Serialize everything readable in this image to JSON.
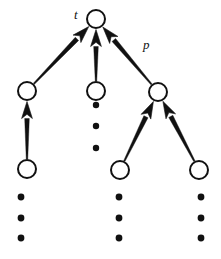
{
  "figure": {
    "type": "tree-diagram",
    "background_color": "#ffffff",
    "stroke_color": "#111111",
    "node_fill_color": "#ffffff",
    "node_stroke_width": 2
  },
  "labels": [
    {
      "name": "root-label",
      "text": "t",
      "x": 74,
      "y": 8
    },
    {
      "name": "edge-label-p",
      "text": "p",
      "x": 143,
      "y": 38
    }
  ],
  "nodes": [
    {
      "id": "t",
      "name": "root-node",
      "cx": 96,
      "cy": 19,
      "r": 9,
      "label": "t"
    },
    {
      "id": "a1",
      "name": "level2-node-left",
      "cx": 27,
      "cy": 91,
      "r": 9,
      "label": ""
    },
    {
      "id": "a2",
      "name": "level2-node-middle",
      "cx": 96,
      "cy": 91,
      "r": 9,
      "label": ""
    },
    {
      "id": "a3",
      "name": "level2-node-right",
      "cx": 158,
      "cy": 92,
      "r": 9,
      "label": ""
    },
    {
      "id": "b1",
      "name": "level3-node-left",
      "cx": 27,
      "cy": 169,
      "r": 9,
      "label": ""
    },
    {
      "id": "b2",
      "name": "level3-node-middle",
      "cx": 120,
      "cy": 170,
      "r": 9,
      "label": ""
    },
    {
      "id": "b3",
      "name": "level3-node-right",
      "cx": 199,
      "cy": 170,
      "r": 9,
      "label": ""
    }
  ],
  "edges": [
    {
      "name": "edge-left-to-root",
      "from": "a1",
      "to": "t",
      "arrow": true,
      "label": ""
    },
    {
      "name": "edge-middle-to-root",
      "from": "a2",
      "to": "t",
      "arrow": true,
      "label": ""
    },
    {
      "name": "edge-right-to-root",
      "from": "a3",
      "to": "t",
      "arrow": true,
      "label": "p"
    },
    {
      "name": "edge-bottomleft-to-left",
      "from": "b1",
      "to": "a1",
      "arrow": true,
      "label": ""
    },
    {
      "name": "edge-bottommid-to-right",
      "from": "b2",
      "to": "a3",
      "arrow": true,
      "label": ""
    },
    {
      "name": "edge-bottomright-to-right",
      "from": "b3",
      "to": "a3",
      "arrow": true,
      "label": ""
    }
  ],
  "ellipses": [
    {
      "name": "ellipsis-middle-branch",
      "x": 96,
      "dots_y": [
        105,
        126,
        148
      ],
      "radius": 3.2
    },
    {
      "name": "ellipsis-bottom-left",
      "x": 21,
      "dots_y": [
        197,
        218,
        238
      ],
      "radius": 3.4
    },
    {
      "name": "ellipsis-bottom-middle",
      "x": 119,
      "dots_y": [
        197,
        218,
        238
      ],
      "radius": 3.4
    },
    {
      "name": "ellipsis-bottom-right",
      "x": 201,
      "dots_y": [
        197,
        218,
        238
      ],
      "radius": 3.4
    }
  ]
}
